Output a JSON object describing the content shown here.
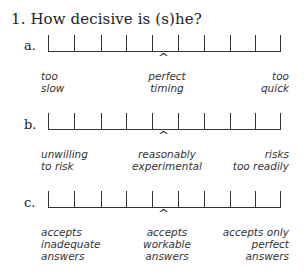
{
  "question": {
    "number": "1.",
    "text": "How decisive is (s)he?"
  },
  "scales": [
    {
      "letter": "a.",
      "tick_count": 10,
      "marker": "^",
      "marker_position": 4.5,
      "anchors": {
        "left": [
          "too",
          "slow"
        ],
        "center": [
          "perfect",
          "timing"
        ],
        "right": [
          "too",
          "quick"
        ]
      }
    },
    {
      "letter": "b.",
      "tick_count": 10,
      "marker": "^",
      "marker_position": 4.5,
      "anchors": {
        "left": [
          "unwilling",
          "to risk"
        ],
        "center": [
          "reasonably",
          "experimental"
        ],
        "right": [
          "risks",
          "too readily"
        ]
      }
    },
    {
      "letter": "c.",
      "tick_count": 10,
      "marker": "^",
      "marker_position": 4.5,
      "anchors": {
        "left": [
          "accepts",
          "inadequate",
          "answers"
        ],
        "center": [
          "accepts",
          "workable",
          "answers"
        ],
        "right": [
          "accepts only",
          "perfect",
          "answers"
        ]
      }
    }
  ]
}
